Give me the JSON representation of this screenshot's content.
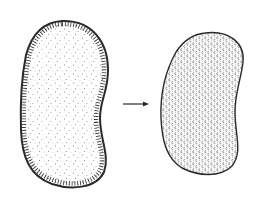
{
  "figure": {
    "colors": {
      "background": "#ffffff",
      "ink": "#2a2a2a",
      "stipple": "#6a6a6a"
    },
    "left_cell": {
      "label": ""
    },
    "arrow": {
      "label": ""
    },
    "right_cell": {
      "label": ""
    }
  }
}
